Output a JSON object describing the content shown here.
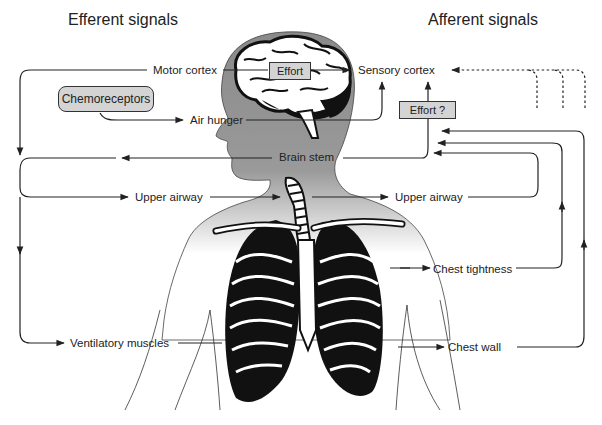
{
  "headings": {
    "efferent": "Efferent signals",
    "afferent": "Afferent signals"
  },
  "boxes": {
    "chemoreceptors": "Chemoreceptors",
    "effort_motor": "Effort",
    "effort_question": "Effort  ?"
  },
  "labels": {
    "motor_cortex": "Motor cortex",
    "sensory_cortex": "Sensory cortex",
    "air_hunger": "Air hunger",
    "brain_stem": "Brain stem",
    "upper_airway_efferent": "Upper airway",
    "upper_airway_afferent": "Upper airway",
    "chest_tightness": "Chest tightness",
    "ventilatory_muscles": "Ventilatory muscles",
    "chest_wall": "Chest wall"
  },
  "colors": {
    "silhouette": "#8c8c8c",
    "box_fill": "#d4d4d4",
    "line": "#222222"
  }
}
